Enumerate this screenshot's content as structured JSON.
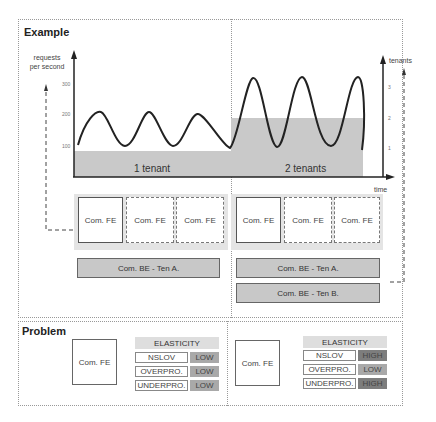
{
  "example": {
    "title": "Example",
    "y_axis_left": {
      "label": "requests per second",
      "ticks": [
        "300",
        "200",
        "100"
      ]
    },
    "y_axis_right": {
      "label": "tenants",
      "ticks": [
        "3",
        "2",
        "1"
      ]
    },
    "x_axis": {
      "label": "time"
    },
    "phases": [
      {
        "label": "1 tenant"
      },
      {
        "label": "2 tenants"
      }
    ],
    "frontends": {
      "left": [
        "Com. FE",
        "Com. FE",
        "Com. FE"
      ],
      "right": [
        "Com. FE",
        "Com. FE",
        "Com. FE"
      ]
    },
    "backends": {
      "left": [
        "Com. BE - Ten A."
      ],
      "right": [
        "Com. BE - Ten A.",
        "Com. BE - Ten B."
      ]
    }
  },
  "problem": {
    "title": "Problem",
    "left": {
      "component": "Com. FE",
      "header": "ELASTICITY",
      "rows": [
        {
          "metric": "NSLOV",
          "level": "LOW"
        },
        {
          "metric": "OVERPRO.",
          "level": "LOW"
        },
        {
          "metric": "UNDERPRO.",
          "level": "LOW"
        }
      ]
    },
    "right": {
      "component": "Com. FE",
      "header": "ELASTICITY",
      "rows": [
        {
          "metric": "NSLOV",
          "level": "HIGH"
        },
        {
          "metric": "OVERPRO.",
          "level": "LOW"
        },
        {
          "metric": "UNDERPRO.",
          "level": "HIGH"
        }
      ]
    }
  },
  "colors": {
    "low": "#a9a9a9",
    "high": "#7d7d7d",
    "band": "#c9c9c9",
    "be": "#c8c8c8"
  }
}
